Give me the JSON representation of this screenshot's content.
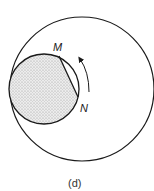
{
  "figure": {
    "caption": "(d)",
    "labels": {
      "m": "M",
      "n": "N"
    },
    "outer_circle": {
      "cx": 82,
      "cy": 89,
      "r": 72
    },
    "inner_circle": {
      "cx": 44,
      "cy": 89,
      "r": 35,
      "fill": "stippled"
    },
    "chord": {
      "from": "M",
      "to": "N"
    },
    "rotation_arrow": {
      "direction": "counterclockwise"
    },
    "colors": {
      "stroke": "#1a1a1a",
      "stipple": "#b0b0b0",
      "background": "#ffffff"
    }
  }
}
